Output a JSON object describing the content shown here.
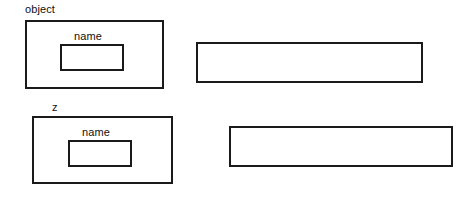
{
  "diagram": {
    "background_color": "#ffffff",
    "stroke_color": "#1a1a1a",
    "text_color": "#111111",
    "groups": [
      {
        "id": "object",
        "label": "object",
        "inner_label": "name"
      },
      {
        "id": "z",
        "label": "z",
        "inner_label": "name"
      }
    ],
    "bars": [
      {
        "id": "bar-top",
        "label": ""
      },
      {
        "id": "bar-bottom",
        "label": ""
      }
    ]
  }
}
